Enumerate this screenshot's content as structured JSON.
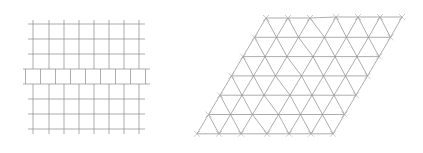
{
  "figure": {
    "panels": [
      {
        "id": "square-lattice",
        "description": "Square grid with a horizontal slip band (middle row offset by half a cell)",
        "vertical_x": [
          33,
          49,
          64,
          79,
          94,
          109,
          124,
          139
        ],
        "horizontal_y": [
          24,
          39,
          54,
          69,
          84,
          99,
          114,
          129
        ],
        "slip_band": {
          "y_top": 69,
          "y_bottom": 84,
          "x_offset": 7.5,
          "x_min": 23,
          "x_max": 150
        },
        "y_min": 20,
        "y_max": 134,
        "x_min": 28,
        "x_max": 145
      },
      {
        "id": "triangular-lattice",
        "description": "Triangular lattice in a parallelogram with dislocation shifts",
        "rows": 7,
        "cols": 7,
        "origin_top_left": [
          266,
          18
        ],
        "dx": 22,
        "dy": 19.3,
        "row_shift": -11.5,
        "line_color": "#8a8a8a"
      }
    ]
  }
}
